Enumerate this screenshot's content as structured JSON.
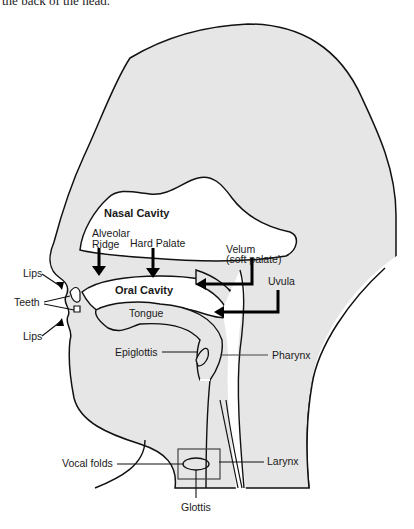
{
  "caption": "the back of the head.",
  "colors": {
    "tissue_fill": "#e6e6e6",
    "outline": "#111111",
    "background": "#ffffff"
  },
  "labels": {
    "nasal_cavity": "Nasal Cavity",
    "alveolar_ridge_1": "Alveolar",
    "alveolar_ridge_2": "Ridge",
    "hard_palate": "Hard Palate",
    "velum_1": "Velum",
    "velum_2": "(soft palate)",
    "uvula": "Uvula",
    "lips_upper": "Lips",
    "teeth": "Teeth",
    "lips_lower": "Lips",
    "oral_cavity": "Oral Cavity",
    "tongue": "Tongue",
    "epiglottis": "Epiglottis",
    "pharynx": "Pharynx",
    "vocal_folds": "Vocal folds",
    "larynx": "Larynx",
    "glottis": "Glottis"
  }
}
